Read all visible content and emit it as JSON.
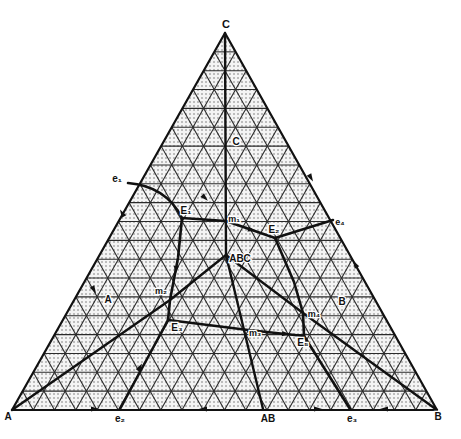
{
  "diagram": {
    "grid_divisions": 20,
    "colors": {
      "line": "#111111",
      "grid": "#2a2a2a",
      "dots": "#6a6a6a",
      "background": "#ffffff"
    },
    "vertices": {
      "A": [
        12,
        410
      ],
      "B": [
        437,
        410
      ],
      "C": [
        225,
        33
      ]
    },
    "labels": [
      {
        "id": "C-vertex",
        "text": "C",
        "x": 226,
        "y": 28,
        "size": 11
      },
      {
        "id": "A-vertex",
        "text": "A",
        "x": 8,
        "y": 420,
        "size": 10
      },
      {
        "id": "B-vertex",
        "text": "B",
        "x": 438,
        "y": 420,
        "size": 10
      },
      {
        "id": "AB-compound",
        "text": "AB",
        "x": 268,
        "y": 422,
        "size": 10
      },
      {
        "id": "e1",
        "text": "e₁",
        "x": 117,
        "y": 182,
        "size": 10
      },
      {
        "id": "e2",
        "text": "e₂",
        "x": 120,
        "y": 422,
        "size": 10
      },
      {
        "id": "e3",
        "text": "e₃",
        "x": 352,
        "y": 422,
        "size": 10
      },
      {
        "id": "e4",
        "text": "e₄",
        "x": 340,
        "y": 225,
        "size": 9
      },
      {
        "id": "E1",
        "text": "E₁",
        "x": 186,
        "y": 214,
        "size": 10
      },
      {
        "id": "m1",
        "text": "m₁",
        "x": 234,
        "y": 222,
        "size": 9
      },
      {
        "id": "E2",
        "text": "E₂",
        "x": 274,
        "y": 233,
        "size": 10
      },
      {
        "id": "ABC",
        "text": "ABC",
        "x": 240,
        "y": 262,
        "size": 10
      },
      {
        "id": "m2",
        "text": "m₂",
        "x": 161,
        "y": 294,
        "size": 9
      },
      {
        "id": "E3",
        "text": "E₃",
        "x": 177,
        "y": 331,
        "size": 10
      },
      {
        "id": "m3",
        "text": "m₃",
        "x": 255,
        "y": 336,
        "size": 9
      },
      {
        "id": "E5",
        "text": "E₅",
        "x": 303,
        "y": 346,
        "size": 10
      },
      {
        "id": "m4",
        "text": "m₄",
        "x": 314,
        "y": 317,
        "size": 9
      },
      {
        "id": "field-C",
        "text": "C",
        "x": 236,
        "y": 145,
        "size": 10
      },
      {
        "id": "field-A",
        "text": "A",
        "x": 108,
        "y": 303,
        "size": 10
      },
      {
        "id": "field-B",
        "text": "B",
        "x": 342,
        "y": 305,
        "size": 10
      }
    ],
    "lines": [
      {
        "id": "curve-e1-E1",
        "type": "curve",
        "d": "M128,183 Q166,186 182,218",
        "weight": 2.6
      },
      {
        "id": "E1-m2-E3",
        "points": [
          [
            182,
            218
          ],
          [
            178,
            258
          ],
          [
            170,
            300
          ],
          [
            168,
            320
          ]
        ],
        "weight": 2.6
      },
      {
        "id": "E1-m1-E2",
        "points": [
          [
            182,
            218
          ],
          [
            226,
            221
          ],
          [
            275,
            238
          ]
        ],
        "weight": 2.6
      },
      {
        "id": "E2-e4",
        "points": [
          [
            275,
            238
          ],
          [
            333,
            220
          ]
        ],
        "weight": 2.6
      },
      {
        "id": "E2-m4-E5",
        "points": [
          [
            275,
            238
          ],
          [
            294,
            282
          ],
          [
            303,
            313
          ],
          [
            304,
            336
          ]
        ],
        "weight": 2.6
      },
      {
        "id": "E5-e3",
        "points": [
          [
            304,
            336
          ],
          [
            350,
            409
          ]
        ],
        "weight": 2.6
      },
      {
        "id": "E3-m3-E5",
        "points": [
          [
            168,
            320
          ],
          [
            248,
            330
          ],
          [
            304,
            336
          ]
        ],
        "weight": 2.6
      },
      {
        "id": "e2-E3",
        "points": [
          [
            120,
            409
          ],
          [
            168,
            320
          ]
        ],
        "weight": 2.6
      },
      {
        "id": "C-ABC-join",
        "points": [
          [
            225,
            33
          ],
          [
            226,
            255
          ]
        ],
        "weight": 2.4
      },
      {
        "id": "ABC-AB-join",
        "points": [
          [
            226,
            255
          ],
          [
            263,
            409
          ]
        ],
        "weight": 2.4
      },
      {
        "id": "A-ABC-join",
        "points": [
          [
            12,
            410
          ],
          [
            170,
            300
          ],
          [
            226,
            255
          ]
        ],
        "weight": 2.4
      },
      {
        "id": "B-ABC-join",
        "points": [
          [
            437,
            410
          ],
          [
            303,
            313
          ],
          [
            226,
            255
          ]
        ],
        "weight": 2.4
      }
    ],
    "arrows": [
      {
        "x": 95,
        "y": 409,
        "angle": 0
      },
      {
        "x": 203,
        "y": 409,
        "angle": 180
      },
      {
        "x": 318,
        "y": 409,
        "angle": 0
      },
      {
        "x": 384,
        "y": 409,
        "angle": 180
      },
      {
        "x": 122,
        "y": 213,
        "angle": 240
      },
      {
        "x": 94,
        "y": 290,
        "angle": 60
      },
      {
        "x": 311,
        "y": 178,
        "angle": 60
      },
      {
        "x": 355,
        "y": 264,
        "angle": 240
      },
      {
        "x": 205,
        "y": 198,
        "angle": 45
      },
      {
        "x": 252,
        "y": 230,
        "angle": 15
      },
      {
        "x": 176,
        "y": 270,
        "angle": 95
      },
      {
        "x": 286,
        "y": 334,
        "angle": 5
      },
      {
        "x": 140,
        "y": 367,
        "angle": 300
      }
    ]
  }
}
